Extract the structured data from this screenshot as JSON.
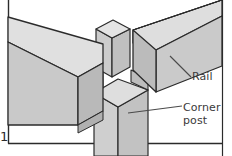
{
  "figure": {
    "number": "1",
    "width": 232,
    "height": 156,
    "background": "#ffffff"
  },
  "labels": {
    "rail": "Rail",
    "corner_post": "Corner\npost",
    "corner_post_line1": "Corner",
    "corner_post_line2": "post",
    "figure_number": "1"
  },
  "colors": {
    "outline": "#2b2b2b",
    "face_top": "#e2e2e2",
    "face_front": "#c8c8c8",
    "face_side": "#d4d4d4",
    "face_end": "#bcbcbc",
    "face_dark": "#b4b4b4",
    "leader_line": "#4a4a4a",
    "frame_rule": "#2b2b2b",
    "text": "#3a3a3a"
  },
  "parts": [
    {
      "name": "left-rail",
      "label": "Rail",
      "faces": [
        "top",
        "front",
        "end"
      ]
    },
    {
      "name": "right-rail",
      "label": "Rail",
      "faces": [
        "top",
        "front",
        "end"
      ]
    },
    {
      "name": "corner-post",
      "label": "Corner post",
      "faces": [
        "left",
        "right",
        "top"
      ]
    },
    {
      "name": "tenon",
      "label": "Tenon",
      "faces": [
        "top",
        "left",
        "right"
      ]
    }
  ],
  "frame": {
    "left_rule": true,
    "bottom_rule": true,
    "right_rule": true
  }
}
